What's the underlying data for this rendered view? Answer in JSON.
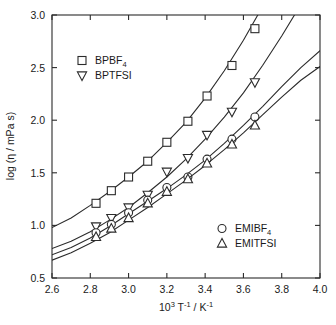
{
  "chart_data": {
    "type": "scatter",
    "title": "",
    "xlabel": "10^3 T^-1 / K^-1",
    "xlabel_parts": {
      "base1": "10",
      "sup1": "3",
      "mid": "T",
      "sup2": "-1",
      "slash": "/ K",
      "sup3": "-1"
    },
    "ylabel": "log (η / mPa s)",
    "xlim": [
      2.6,
      4.0
    ],
    "ylim": [
      0.5,
      3.0
    ],
    "xticks": [
      "2.6",
      "2.8",
      "3.0",
      "3.2",
      "3.4",
      "3.6",
      "3.8",
      "4.0"
    ],
    "xtick_values": [
      2.6,
      2.8,
      3.0,
      3.2,
      3.4,
      3.6,
      3.8,
      4.0
    ],
    "yticks": [
      "0.5",
      "1.0",
      "1.5",
      "2.0",
      "2.5",
      "3.0"
    ],
    "ytick_values": [
      0.5,
      1.0,
      1.5,
      2.0,
      2.5,
      3.0
    ],
    "grid": false,
    "legend_position": "inside-top-left and inside-bottom-right",
    "series": [
      {
        "name": "BPBF4",
        "label_base": "BPBF",
        "label_sub": "4",
        "marker": "square",
        "x": [
          2.83,
          2.91,
          3.0,
          3.1,
          3.2,
          3.31,
          3.41,
          3.54,
          3.66
        ],
        "values": [
          1.21,
          1.33,
          1.46,
          1.61,
          1.79,
          1.99,
          2.23,
          2.52,
          2.87
        ],
        "fit_x": [
          2.6,
          2.7,
          2.8,
          2.9,
          3.0,
          3.1,
          3.2,
          3.3,
          3.4,
          3.5,
          3.6,
          3.7,
          3.76
        ],
        "fit_y": [
          0.98,
          1.07,
          1.19,
          1.32,
          1.46,
          1.61,
          1.79,
          1.98,
          2.21,
          2.47,
          2.76,
          3.08,
          3.22
        ]
      },
      {
        "name": "BPTFSI",
        "label_base": "BPTFSI",
        "label_sub": "",
        "marker": "triangle-down",
        "x": [
          2.83,
          2.91,
          3.0,
          3.1,
          3.2,
          3.31,
          3.41,
          3.54,
          3.66
        ],
        "values": [
          0.99,
          1.07,
          1.17,
          1.29,
          1.51,
          1.64,
          1.86,
          2.08,
          2.36
        ],
        "fit_x": [
          2.6,
          2.7,
          2.8,
          2.9,
          3.0,
          3.1,
          3.2,
          3.3,
          3.4,
          3.5,
          3.6,
          3.7,
          3.8,
          3.9,
          3.94
        ],
        "fit_y": [
          0.78,
          0.85,
          0.94,
          1.05,
          1.17,
          1.31,
          1.46,
          1.63,
          1.82,
          2.03,
          2.26,
          2.52,
          2.8,
          3.1,
          3.22
        ]
      },
      {
        "name": "EMIBF4",
        "label_base": "EMIBF",
        "label_sub": "4",
        "marker": "circle",
        "x": [
          2.83,
          2.91,
          3.0,
          3.1,
          3.2,
          3.31,
          3.41,
          3.54,
          3.66
        ],
        "values": [
          0.93,
          1.01,
          1.12,
          1.24,
          1.36,
          1.46,
          1.63,
          1.82,
          2.03
        ],
        "fit_x": [
          2.6,
          2.7,
          2.8,
          2.9,
          3.0,
          3.1,
          3.2,
          3.3,
          3.4,
          3.5,
          3.6,
          3.7,
          3.8,
          3.9,
          4.0
        ],
        "fit_y": [
          0.72,
          0.79,
          0.88,
          0.99,
          1.11,
          1.23,
          1.35,
          1.48,
          1.62,
          1.78,
          1.95,
          2.13,
          2.32,
          2.5,
          2.66
        ]
      },
      {
        "name": "EMITFSI",
        "label_base": "EMITFSI",
        "label_sub": "",
        "marker": "triangle-up",
        "x": [
          2.83,
          2.91,
          3.0,
          3.1,
          3.2,
          3.31,
          3.41,
          3.54,
          3.66
        ],
        "values": [
          0.89,
          0.97,
          1.07,
          1.21,
          1.32,
          1.44,
          1.59,
          1.77,
          1.95
        ],
        "fit_x": [
          2.6,
          2.7,
          2.8,
          2.9,
          3.0,
          3.1,
          3.2,
          3.3,
          3.4,
          3.5,
          3.6,
          3.7,
          3.8,
          3.9,
          4.0
        ],
        "fit_y": [
          0.67,
          0.74,
          0.83,
          0.93,
          1.05,
          1.17,
          1.3,
          1.43,
          1.57,
          1.72,
          1.88,
          2.05,
          2.22,
          2.38,
          2.51
        ]
      }
    ],
    "legend_groups": [
      {
        "id": "top",
        "entries": [
          "BPBF4",
          "BPTFSI"
        ]
      },
      {
        "id": "bottom",
        "entries": [
          "EMIBF4",
          "EMITFSI"
        ]
      }
    ],
    "colors": {
      "line": "#2b2b2b",
      "marker_fill": "#ffffff",
      "background": "#ffffff"
    }
  }
}
